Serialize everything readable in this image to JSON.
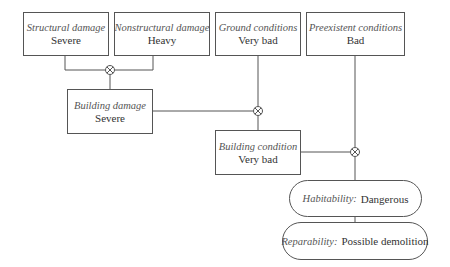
{
  "diagram": {
    "inputs": [
      {
        "label": "Structural damage",
        "value": "Severe"
      },
      {
        "label": "Nonstructural damage",
        "value": "Heavy"
      },
      {
        "label": "Ground conditions",
        "value": "Very bad"
      },
      {
        "label": "Preexistent conditions",
        "value": "Bad"
      }
    ],
    "intermediate": [
      {
        "label": "Building damage",
        "value": "Severe"
      },
      {
        "label": "Building condition",
        "value": "Very bad"
      }
    ],
    "outputs": [
      {
        "label": "Habitability:",
        "value": "Dangerous"
      },
      {
        "label": "Reparability:",
        "value": "Possible demolition"
      }
    ],
    "combiner_symbol": "⊗",
    "colors": {
      "line": "#555555",
      "text": "#333333",
      "background": "#ffffff"
    }
  }
}
